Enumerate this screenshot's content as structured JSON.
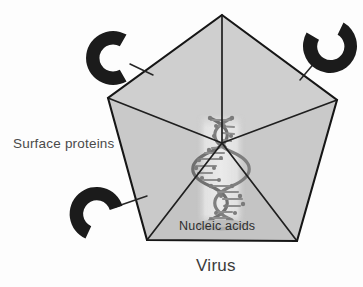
{
  "figure": {
    "title_caption": "Virus",
    "labels": {
      "surface_proteins": "Surface proteins",
      "nucleic_acids": "Nucleic acids",
      "caption": "Virus"
    },
    "colors": {
      "capsid_face_light": "#d2d2d2",
      "capsid_face_mid": "#c6c6c6",
      "capsid_face_dark": "#bdbdbd",
      "capsid_edge": "#1d1d1d",
      "spike_fill": "#1c1c1c",
      "leader_line": "#2a2a2a",
      "interior_panel": "#e3e3e3",
      "dna_strand": "#6f6f6f",
      "dna_base": "#8c8c8c",
      "background": "#ffffff",
      "label_text": "#3a3a3a"
    },
    "capsid": {
      "shape": "pentagon",
      "description": "icosahedral capsid drawn as a pentagon with five internal triangular facets meeting at a central vertex",
      "vertices": [
        {
          "x": 222,
          "y": 15
        },
        {
          "x": 337,
          "y": 100
        },
        {
          "x": 297,
          "y": 241
        },
        {
          "x": 147,
          "y": 240
        },
        {
          "x": 108,
          "y": 98
        }
      ],
      "center": {
        "x": 222,
        "y": 143
      },
      "facet_count": 5
    },
    "spikes": [
      {
        "name": "surface-protein-spike-top-left",
        "center": {
          "x": 113,
          "y": 58
        },
        "radius_outer": 27,
        "radius_inner": 13,
        "opening_direction": "right",
        "start_angle_deg": 60,
        "sweep_deg": 240,
        "leader": {
          "x1": 131,
          "y1": 65,
          "x2": 152,
          "y2": 74
        }
      },
      {
        "name": "surface-protein-spike-top-right",
        "center": {
          "x": 330,
          "y": 46
        },
        "radius_outer": 27,
        "radius_inner": 13,
        "opening_direction": "up-right",
        "start_angle_deg": 150,
        "sweep_deg": 240,
        "leader": {
          "x1": 315,
          "y1": 62,
          "x2": 299,
          "y2": 79
        }
      },
      {
        "name": "surface-protein-spike-bottom-left",
        "center": {
          "x": 97,
          "y": 215
        },
        "radius_outer": 27,
        "radius_inner": 13,
        "opening_direction": "down-left",
        "start_angle_deg": -20,
        "sweep_deg": 240,
        "leader": {
          "x1": 116,
          "y1": 207,
          "x2": 146,
          "y2": 197
        }
      }
    ],
    "nucleic_acid": {
      "name": "dna-double-helix",
      "panel": {
        "x": 196,
        "y": 118,
        "width": 48,
        "height": 108
      },
      "turns": 4,
      "base_plate": {
        "cx": 220,
        "cy": 225,
        "rx": 24,
        "ry": 6
      }
    }
  }
}
